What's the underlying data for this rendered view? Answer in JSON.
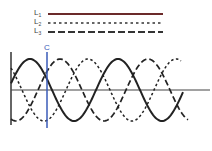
{
  "legend": {
    "items": [
      {
        "id": "L1",
        "main": "L",
        "sub": "1",
        "style": "solid",
        "color": "#6b2a2a"
      },
      {
        "id": "L2",
        "main": "L",
        "sub": "2",
        "style": "dotted",
        "color": "#333333"
      },
      {
        "id": "L3",
        "main": "L",
        "sub": "3",
        "style": "dashed",
        "color": "#333333"
      }
    ]
  },
  "marker": {
    "label": "C",
    "color": "#3a5bb8"
  },
  "diagram": {
    "type": "three-phase sine waves",
    "axis_color": "#333333",
    "curve_color": "#222222",
    "waves": [
      {
        "name": "L1",
        "style": "solid",
        "peak_x": 30,
        "x_end": 183
      },
      {
        "name": "L2",
        "style": "dotted",
        "peak_x": 0,
        "x_end": 181
      },
      {
        "name": "L3",
        "style": "dashed",
        "peak_x": 60,
        "x_end": 188
      }
    ],
    "period_px": 88,
    "amplitude_px": 31,
    "center_y": 90,
    "x_start": 11
  }
}
